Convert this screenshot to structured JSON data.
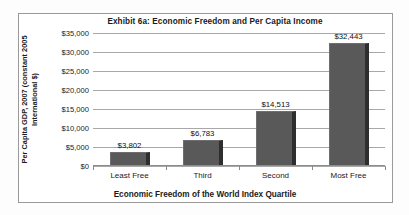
{
  "chart_data": {
    "type": "bar",
    "title": "Exhibit 6a:  Economic Freedom and Per Capita Income",
    "xlabel": "Economic Freedom of the World Index Quartile",
    "ylabel": "Per Capita GDP, 2007 (constant 2005 International $)",
    "categories": [
      "Least Free",
      "Third",
      "Second",
      "Most Free"
    ],
    "values": [
      3802,
      6783,
      14513,
      32443
    ],
    "value_labels": [
      "$3,802",
      "$6,783",
      "$14,513",
      "$32,443"
    ],
    "ylim": [
      0,
      35000
    ],
    "ytick_values": [
      0,
      5000,
      10000,
      15000,
      20000,
      25000,
      30000,
      35000
    ],
    "ytick_labels": [
      "$0",
      "$5,000",
      "$10,000",
      "$15,000",
      "$20,000",
      "$25,000",
      "$30,000",
      "$35,000"
    ],
    "grid": true,
    "legend": false,
    "bar_color": "#595959",
    "bar_edge_color": "#2e2e2e",
    "gridline_color": "#a8a8a8",
    "plot_background": "#ffffff",
    "frame_border_color": "#9a9a9a"
  }
}
